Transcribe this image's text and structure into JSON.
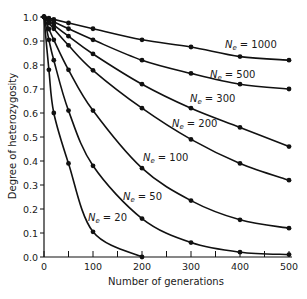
{
  "chart_data": {
    "type": "line",
    "title": "",
    "xlabel": "Number of generations",
    "ylabel": "Degree of heterozygosity",
    "xlim": [
      0,
      500
    ],
    "ylim": [
      0.0,
      1.0
    ],
    "xticks": [
      0,
      100,
      200,
      300,
      400,
      500
    ],
    "xtick_labels": [
      "0",
      "100",
      "200",
      "300",
      "400",
      "500"
    ],
    "xminor": [
      50,
      150,
      250,
      350,
      450
    ],
    "yticks": [
      0.0,
      0.1,
      0.2,
      0.3,
      0.4,
      0.5,
      0.6,
      0.7,
      0.8,
      0.9,
      1.0
    ],
    "ytick_labels": [
      "0.0",
      "0.1",
      "0.2",
      "0.3",
      "0.4",
      "0.5",
      "0.6",
      "0.7",
      "0.8",
      "0.9",
      "1.0"
    ],
    "grid": false,
    "legend": "inline labels",
    "x": [
      0,
      10,
      20,
      50,
      100,
      200,
      300,
      400,
      500
    ],
    "series": [
      {
        "name": "Ne = 1000",
        "label_main": "N",
        "label_sub": "e",
        "label_val": "= 1000",
        "values": [
          1.0,
          0.995,
          0.99,
          0.975,
          0.951,
          0.905,
          0.875,
          0.835,
          0.82
        ],
        "label_pos": [
          225,
          48
        ]
      },
      {
        "name": "Ne = 500",
        "label_main": "N",
        "label_sub": "e",
        "label_val": "= 500",
        "values": [
          1.0,
          0.99,
          0.98,
          0.951,
          0.905,
          0.82,
          0.765,
          0.72,
          0.7
        ],
        "label_pos": [
          210,
          78
        ]
      },
      {
        "name": "Ne = 300",
        "label_main": "N",
        "label_sub": "e",
        "label_val": "= 300",
        "values": [
          1.0,
          0.984,
          0.967,
          0.92,
          0.846,
          0.72,
          0.62,
          0.54,
          0.46
        ],
        "label_pos": [
          190,
          102
        ]
      },
      {
        "name": "Ne = 200",
        "label_main": "N",
        "label_sub": "e",
        "label_val": "= 200",
        "values": [
          1.0,
          0.975,
          0.951,
          0.882,
          0.778,
          0.62,
          0.49,
          0.39,
          0.32
        ],
        "label_pos": [
          172,
          127
        ]
      },
      {
        "name": "Ne = 100",
        "label_main": "N",
        "label_sub": "e",
        "label_val": "= 100",
        "values": [
          1.0,
          0.95,
          0.905,
          0.78,
          0.61,
          0.37,
          0.235,
          0.155,
          0.12
        ],
        "label_pos": [
          143,
          161
        ]
      },
      {
        "name": "Ne = 50",
        "label_main": "N",
        "label_sub": "e",
        "label_val": "= 50",
        "values": [
          1.0,
          0.905,
          0.82,
          0.61,
          0.38,
          0.16,
          0.06,
          0.02,
          0.01
        ],
        "label_pos": [
          123,
          200
        ]
      },
      {
        "name": "Ne = 20",
        "label_main": "N",
        "label_sub": "e",
        "label_val": "= 20",
        "values": [
          1.0,
          0.78,
          0.6,
          0.39,
          0.105,
          0.0,
          null,
          null,
          null
        ],
        "label_pos": [
          88,
          221
        ]
      }
    ]
  }
}
